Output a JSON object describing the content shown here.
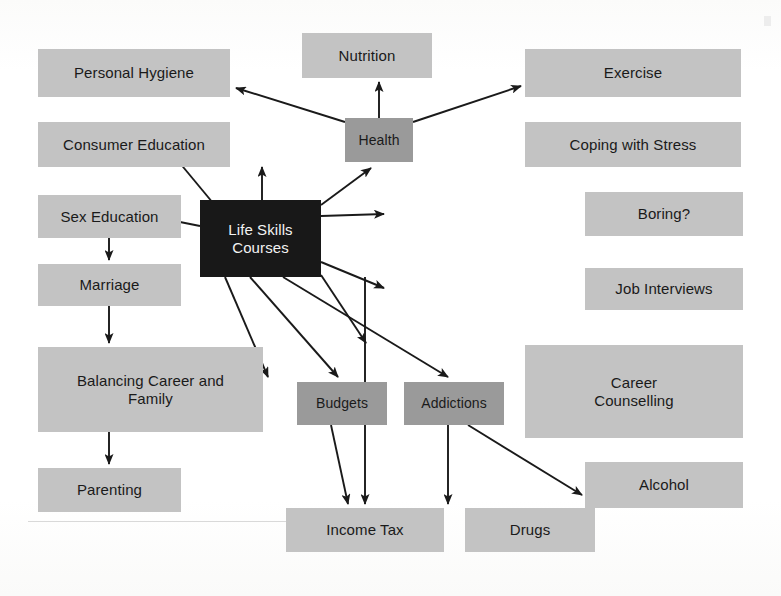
{
  "diagram": {
    "title": "Life Skills Courses",
    "type": "concept-map",
    "background_color": "#fdfdfd",
    "palette": {
      "light_box": "#c3c3c3",
      "medium_box": "#9a9a9a",
      "dark_box": "#181818",
      "dark_box_text": "#f2f2f2",
      "box_text": "#1a1a1a",
      "arrow": "#1a1a1a"
    },
    "nodes": [
      {
        "id": "life_skills",
        "label": "Life Skills Courses",
        "tone": "dark",
        "x": 200,
        "y": 200,
        "w": 121,
        "h": 77,
        "font_size": 15
      },
      {
        "id": "health",
        "label": "Health",
        "tone": "medium",
        "x": 345,
        "y": 118,
        "w": 68,
        "h": 44,
        "font_size": 14
      },
      {
        "id": "nutrition",
        "label": "Nutrition",
        "tone": "light",
        "x": 302,
        "y": 33,
        "w": 130,
        "h": 45,
        "font_size": 15
      },
      {
        "id": "personal_hygiene",
        "label": "Personal Hygiene",
        "tone": "light",
        "x": 38,
        "y": 49,
        "w": 192,
        "h": 48,
        "font_size": 15
      },
      {
        "id": "consumer_education",
        "label": "Consumer Education",
        "tone": "light",
        "x": 38,
        "y": 122,
        "w": 192,
        "h": 45,
        "font_size": 15
      },
      {
        "id": "sex_education",
        "label": "Sex Education",
        "tone": "light",
        "x": 38,
        "y": 195,
        "w": 143,
        "h": 43,
        "font_size": 15
      },
      {
        "id": "marriage",
        "label": "Marriage",
        "tone": "light",
        "x": 38,
        "y": 264,
        "w": 143,
        "h": 42,
        "font_size": 15
      },
      {
        "id": "balancing",
        "label": "Balancing Career and\nFamily",
        "tone": "light",
        "x": 38,
        "y": 347,
        "w": 225,
        "h": 85,
        "font_size": 15
      },
      {
        "id": "parenting",
        "label": "Parenting",
        "tone": "light",
        "x": 38,
        "y": 468,
        "w": 143,
        "h": 44,
        "font_size": 15
      },
      {
        "id": "exercise",
        "label": "Exercise",
        "tone": "light",
        "x": 525,
        "y": 49,
        "w": 216,
        "h": 48,
        "font_size": 15
      },
      {
        "id": "coping",
        "label": "Coping with Stress",
        "tone": "light",
        "x": 525,
        "y": 122,
        "w": 216,
        "h": 45,
        "font_size": 15
      },
      {
        "id": "boring",
        "label": "Boring?",
        "tone": "light",
        "x": 585,
        "y": 192,
        "w": 158,
        "h": 44,
        "font_size": 15
      },
      {
        "id": "job_interviews",
        "label": "Job Interviews",
        "tone": "light",
        "x": 585,
        "y": 268,
        "w": 158,
        "h": 42,
        "font_size": 15
      },
      {
        "id": "career_counselling",
        "label": "Career\nCounselling",
        "tone": "light",
        "x": 525,
        "y": 345,
        "w": 218,
        "h": 93,
        "font_size": 15
      },
      {
        "id": "alcohol",
        "label": "Alcohol",
        "tone": "light",
        "x": 585,
        "y": 462,
        "w": 158,
        "h": 46,
        "font_size": 15
      },
      {
        "id": "budgets",
        "label": "Budgets",
        "tone": "medium",
        "x": 297,
        "y": 382,
        "w": 90,
        "h": 43,
        "font_size": 14
      },
      {
        "id": "addictions",
        "label": "Addictions",
        "tone": "medium",
        "x": 404,
        "y": 382,
        "w": 100,
        "h": 43,
        "font_size": 14
      },
      {
        "id": "income_tax",
        "label": "Income Tax",
        "tone": "light",
        "x": 286,
        "y": 508,
        "w": 158,
        "h": 44,
        "font_size": 15
      },
      {
        "id": "drugs",
        "label": "Drugs",
        "tone": "light",
        "x": 465,
        "y": 508,
        "w": 130,
        "h": 44,
        "font_size": 15
      }
    ],
    "edges": [
      {
        "id": "health-nutrition",
        "from": "health",
        "to": "nutrition",
        "x1": 379,
        "y1": 118,
        "x2": 379,
        "y2": 82
      },
      {
        "id": "health-personal-hygiene",
        "from": "health",
        "to": "personal_hygiene",
        "x1": 345,
        "y1": 122,
        "x2": 236,
        "y2": 88
      },
      {
        "id": "health-exercise",
        "from": "health",
        "to": "exercise",
        "x1": 413,
        "y1": 122,
        "x2": 521,
        "y2": 86
      },
      {
        "id": "life-health",
        "from": "life_skills",
        "to": "health",
        "x1": 262,
        "y1": 200,
        "x2": 262,
        "y2": 167
      },
      {
        "id": "life-consumer-education",
        "from": "life_skills",
        "to": "consumer_education",
        "x1": 213,
        "y1": 203,
        "x2": 174,
        "y2": 156
      },
      {
        "id": "life-sex-education",
        "from": "life_skills",
        "to": "sex_education",
        "x1": 200,
        "y1": 226,
        "x2": 140,
        "y2": 214
      },
      {
        "id": "life-coping",
        "from": "life_skills",
        "to": "coping",
        "x1": 321,
        "y1": 205,
        "x2": 371,
        "y2": 168
      },
      {
        "id": "life-boring",
        "from": "life_skills",
        "to": "boring",
        "x1": 321,
        "y1": 216,
        "x2": 384,
        "y2": 214
      },
      {
        "id": "life-job-interviews",
        "from": "life_skills",
        "to": "job_interviews",
        "x1": 321,
        "y1": 262,
        "x2": 384,
        "y2": 288
      },
      {
        "id": "life-career-counselling",
        "from": "life_skills",
        "to": "career_counselling",
        "x1": 321,
        "y1": 275,
        "x2": 366,
        "y2": 343
      },
      {
        "id": "life-balancing",
        "from": "life_skills",
        "to": "balancing",
        "x1": 225,
        "y1": 277,
        "x2": 268,
        "y2": 377
      },
      {
        "id": "life-budgets",
        "from": "life_skills",
        "to": "budgets",
        "x1": 250,
        "y1": 277,
        "x2": 338,
        "y2": 377
      },
      {
        "id": "life-income-tax",
        "from": "life_skills",
        "to": "income_tax",
        "x1": 365,
        "y1": 277,
        "x2": 365,
        "y2": 504
      },
      {
        "id": "life-addictions",
        "from": "life_skills",
        "to": "addictions",
        "x1": 283,
        "y1": 277,
        "x2": 448,
        "y2": 377
      },
      {
        "id": "sex-education-marriage",
        "from": "sex_education",
        "to": "marriage",
        "x1": 109,
        "y1": 238,
        "x2": 109,
        "y2": 260
      },
      {
        "id": "marriage-balancing",
        "from": "marriage",
        "to": "balancing",
        "x1": 109,
        "y1": 306,
        "x2": 109,
        "y2": 343
      },
      {
        "id": "balancing-parenting",
        "from": "balancing",
        "to": "parenting",
        "x1": 109,
        "y1": 432,
        "x2": 109,
        "y2": 464
      },
      {
        "id": "budgets-income-tax",
        "from": "budgets",
        "to": "income_tax",
        "x1": 331,
        "y1": 425,
        "x2": 348,
        "y2": 504
      },
      {
        "id": "addictions-drugs",
        "from": "addictions",
        "to": "drugs",
        "x1": 448,
        "y1": 425,
        "x2": 448,
        "y2": 504
      },
      {
        "id": "addictions-alcohol",
        "from": "addictions",
        "to": "alcohol",
        "x1": 468,
        "y1": 425,
        "x2": 582,
        "y2": 495
      }
    ]
  }
}
